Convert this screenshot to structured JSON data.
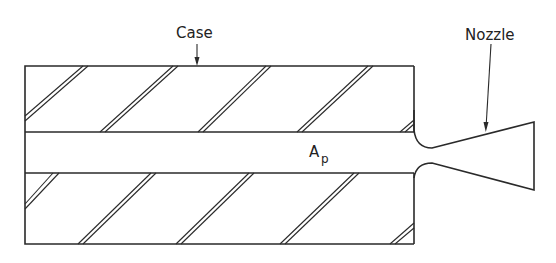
{
  "diagram": {
    "labels": {
      "case": "Case",
      "nozzle": "Nozzle",
      "port_area_main": "A",
      "port_area_sub": "p"
    },
    "colors": {
      "line": "#2a2a2a",
      "background": "#ffffff"
    }
  }
}
